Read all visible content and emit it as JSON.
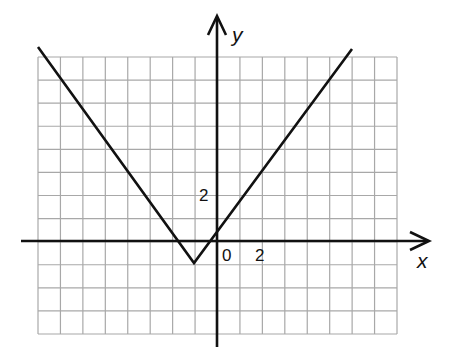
{
  "chart_data": {
    "type": "line",
    "title": "",
    "xlabel": "x",
    "ylabel": "y",
    "function": "y = (4/3)|x + 1| - 1",
    "grid": true,
    "grid_unit": 1,
    "xlim": [
      -8,
      8
    ],
    "ylim": [
      -4,
      8
    ],
    "tick_labels": {
      "x": [
        "0",
        "2"
      ],
      "y": [
        "2"
      ]
    },
    "series": [
      {
        "name": "V-shaped graph",
        "x": [
          -8,
          -1,
          6
        ],
        "y": [
          8.33,
          -1,
          8.33
        ]
      }
    ],
    "vertex": [
      -1,
      -1
    ],
    "y_intercept": 0.33
  },
  "labels": {
    "x_axis": "x",
    "y_axis": "y",
    "origin": "0",
    "x_tick": "2",
    "y_tick": "2"
  }
}
